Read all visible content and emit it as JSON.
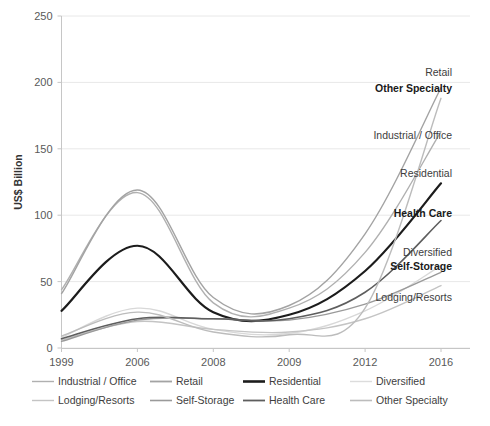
{
  "chart_data": {
    "type": "line",
    "title": "",
    "xlabel": "",
    "ylabel": "US$ Billion",
    "categories": [
      "1999",
      "2006",
      "2008",
      "2009",
      "2012",
      "2016"
    ],
    "ylim": [
      0,
      250
    ],
    "yticks": [
      0,
      50,
      100,
      150,
      200,
      250
    ],
    "grid": true,
    "legend_position": "bottom",
    "series": [
      {
        "name": "Industrial / Office",
        "color": "#b0b0b0",
        "width": 1.4,
        "bold_label": false,
        "end_label": "Industrial / Office",
        "values": [
          44,
          117,
          34,
          30,
          72,
          163
        ]
      },
      {
        "name": "Retail",
        "color": "#a3a3a3",
        "width": 1.4,
        "bold_label": false,
        "end_label": "Retail",
        "values": [
          41,
          119,
          38,
          32,
          86,
          196
        ]
      },
      {
        "name": "Residential",
        "color": "#1c1c1c",
        "width": 2.2,
        "bold_label": false,
        "end_label": "Residential",
        "values": [
          28,
          77,
          27,
          25,
          58,
          124
        ]
      },
      {
        "name": "Diversified",
        "color": "#d8d8d8",
        "width": 1.4,
        "bold_label": false,
        "end_label": "Diversified",
        "values": [
          8,
          30,
          14,
          11,
          28,
          62
        ]
      },
      {
        "name": "Lodging/Resorts",
        "color": "#c4c4c4",
        "width": 1.4,
        "bold_label": false,
        "end_label": "Lodging/Resorts",
        "values": [
          6,
          20,
          14,
          12,
          22,
          47
        ]
      },
      {
        "name": "Self-Storage",
        "color": "#9a9a9a",
        "width": 1.4,
        "bold_label": true,
        "end_label": "Self-Storage",
        "values": [
          5,
          21,
          22,
          21,
          33,
          57
        ]
      },
      {
        "name": "Health Care",
        "color": "#5e5e5e",
        "width": 1.6,
        "bold_label": true,
        "end_label": "Health Care",
        "values": [
          7,
          22,
          22,
          22,
          42,
          96
        ]
      },
      {
        "name": "Other Specialty",
        "color": "#bcbcbc",
        "width": 1.4,
        "bold_label": true,
        "end_label": "Other Specialty",
        "values": [
          9,
          27,
          12,
          10,
          30,
          188
        ]
      }
    ],
    "end_labels": [
      {
        "text": "Retail",
        "bold": false,
        "x": 452,
        "y": 76
      },
      {
        "text": "Other Specialty",
        "bold": true,
        "x": 452,
        "y": 92
      },
      {
        "text": "Industrial / Office",
        "bold": false,
        "x": 452,
        "y": 139
      },
      {
        "text": "Residential",
        "bold": false,
        "x": 452,
        "y": 177
      },
      {
        "text": "Health Care",
        "bold": true,
        "x": 452,
        "y": 217
      },
      {
        "text": "Diversified",
        "bold": false,
        "x": 452,
        "y": 256
      },
      {
        "text": "Self-Storage",
        "bold": true,
        "x": 452,
        "y": 270
      },
      {
        "text": "Lodging/Resorts",
        "bold": false,
        "x": 452,
        "y": 301
      }
    ],
    "legend": [
      {
        "label": "Industrial / Office",
        "color": "#b0b0b0",
        "width": 1.4
      },
      {
        "label": "Retail",
        "color": "#a3a3a3",
        "width": 1.8
      },
      {
        "label": "Residential",
        "color": "#1c1c1c",
        "width": 2.6
      },
      {
        "label": "Diversified",
        "color": "#dcdcdc",
        "width": 1.4
      },
      {
        "label": "Lodging/Resorts",
        "color": "#c4c4c4",
        "width": 1.4
      },
      {
        "label": "Self-Storage",
        "color": "#9a9a9a",
        "width": 1.6
      },
      {
        "label": "Health Care",
        "color": "#5e5e5e",
        "width": 1.8
      },
      {
        "label": "Other Specialty",
        "color": "#bcbcbc",
        "width": 1.6
      }
    ]
  },
  "axis": {
    "y_title": "US$ Billion",
    "y_ticks": [
      "250",
      "200",
      "150",
      "100",
      "50",
      "0"
    ],
    "x_ticks": [
      "1999",
      "2006",
      "2008",
      "2009",
      "2012",
      "2016"
    ]
  },
  "footer": {
    "caption": ""
  }
}
